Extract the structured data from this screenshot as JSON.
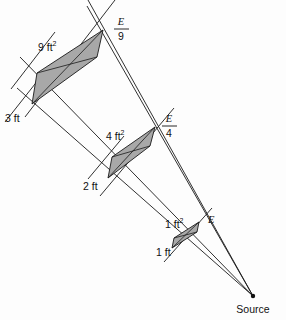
{
  "figure": {
    "background_color": "#fdfdfd",
    "line_color": "#1a1a1a",
    "fill_color": "#a8a8a8",
    "source": {
      "label": "Source",
      "x": 253,
      "y": 296
    },
    "panels": [
      {
        "name": "panel-1ft",
        "area_label": "1 ft",
        "area_exponent": "2",
        "distance_label": "1 ft",
        "intensity_numerator": "E",
        "intensity_denominator": "",
        "intensity_display": "E",
        "distance_ft": 1,
        "area_sqft": 1,
        "relative_intensity": 1
      },
      {
        "name": "panel-4ft",
        "area_label": "4 ft",
        "area_exponent": "2",
        "distance_label": "2 ft",
        "intensity_numerator": "E",
        "intensity_denominator": "4",
        "intensity_display": "E/4",
        "distance_ft": 2,
        "area_sqft": 4,
        "relative_intensity": 0.25
      },
      {
        "name": "panel-9ft",
        "area_label": "9 ft",
        "area_exponent": "2",
        "distance_label": "3 ft",
        "intensity_numerator": "E",
        "intensity_denominator": "9",
        "intensity_display": "E/9",
        "distance_ft": 3,
        "area_sqft": 9,
        "relative_intensity": 0.1111
      }
    ]
  }
}
